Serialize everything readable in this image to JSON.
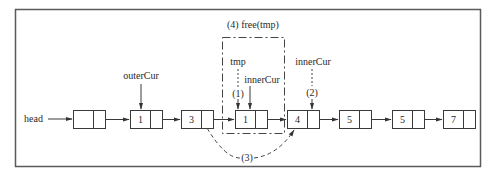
{
  "diagram": {
    "head_label": "head",
    "nodes": [
      {
        "id": "n0",
        "value": ""
      },
      {
        "id": "n1",
        "value": "1"
      },
      {
        "id": "n2",
        "value": "3"
      },
      {
        "id": "n3",
        "value": "1"
      },
      {
        "id": "n4",
        "value": "4"
      },
      {
        "id": "n5",
        "value": "5"
      },
      {
        "id": "n6",
        "value": "5"
      },
      {
        "id": "n7",
        "value": "7"
      }
    ],
    "pointers": {
      "outer_cur": "outerCur",
      "tmp": "tmp",
      "inner_cur_old": "innerCur",
      "inner_cur_new": "innerCur"
    },
    "steps": {
      "step1": "(1)",
      "step2": "(2)",
      "step3": "(3)",
      "step4": "(4) free(tmp)"
    }
  }
}
